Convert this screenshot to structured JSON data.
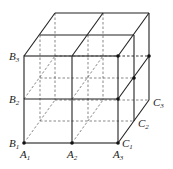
{
  "diagram": {
    "type": "cube-subdivided-2x2x2",
    "labels": [
      {
        "id": "B3",
        "letter": "B",
        "sub": "3"
      },
      {
        "id": "B2",
        "letter": "B",
        "sub": "2"
      },
      {
        "id": "B1",
        "letter": "B",
        "sub": "1"
      },
      {
        "id": "A1",
        "letter": "A",
        "sub": "1"
      },
      {
        "id": "A2",
        "letter": "A",
        "sub": "2"
      },
      {
        "id": "A3",
        "letter": "A",
        "sub": "3"
      },
      {
        "id": "C1",
        "letter": "C",
        "sub": "1"
      },
      {
        "id": "C2",
        "letter": "C",
        "sub": "2"
      },
      {
        "id": "C3",
        "letter": "C",
        "sub": "3"
      }
    ],
    "colors": {
      "line": "#222222",
      "dashed": "#555555",
      "background": "#ffffff"
    }
  }
}
